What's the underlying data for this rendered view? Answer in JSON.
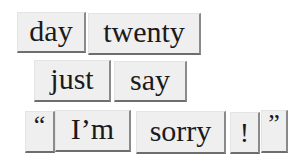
{
  "tiles": {
    "row1": [
      {
        "id": "day",
        "text": "day"
      },
      {
        "id": "twenty",
        "text": "twenty"
      }
    ],
    "row2": [
      {
        "id": "just",
        "text": "just"
      },
      {
        "id": "say",
        "text": "say"
      }
    ],
    "row3": [
      {
        "id": "left-quote",
        "text": "“"
      },
      {
        "id": "im",
        "text": "I’m"
      },
      {
        "id": "sorry",
        "text": "sorry"
      },
      {
        "id": "exclamation",
        "text": "!"
      },
      {
        "id": "right-quote",
        "text": "”"
      }
    ]
  }
}
